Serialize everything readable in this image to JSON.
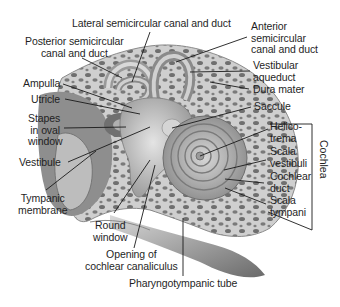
{
  "diagram": {
    "labels": {
      "lateral_canal": "Lateral semicircular canal and duct",
      "posterior_canal": "Posterior semicircular\ncanal and duct",
      "anterior_canal": "Anterior\nsemicircular\ncanal and duct",
      "vestibular_aqueduct": "Vestibular\naqueduct",
      "dura_mater": "Dura mater",
      "ampulla": "Ampulla",
      "utricle": "Utricle",
      "saccule": "Saccule",
      "stapes": "Stapes\nin oval\nwindow",
      "helicotrema": "Helico-\ntrema",
      "scala_vestibuli": "Scala\nvestibuli",
      "vestibule": "Vestibule",
      "cochlear_duct": "Cochlear\nduct",
      "scala_tympani": "Scala\ntympani",
      "tympanic_membrane": "Tympanic\nmembrane",
      "round_window": "Round\nwindow",
      "cochlear_canaliculus": "Opening of\ncochlear canaliculus",
      "pharyngotympanic_tube": "Pharyngotympanic tube",
      "cochlea_bracket": "Cochlea"
    },
    "colors": {
      "bone": "#c9c9c9",
      "bone_pore": "#6e6e6e",
      "membrane": "#a8a8a8",
      "dark_shadow": "#5a5a5a",
      "leader_line": "#1a1a1a"
    }
  }
}
